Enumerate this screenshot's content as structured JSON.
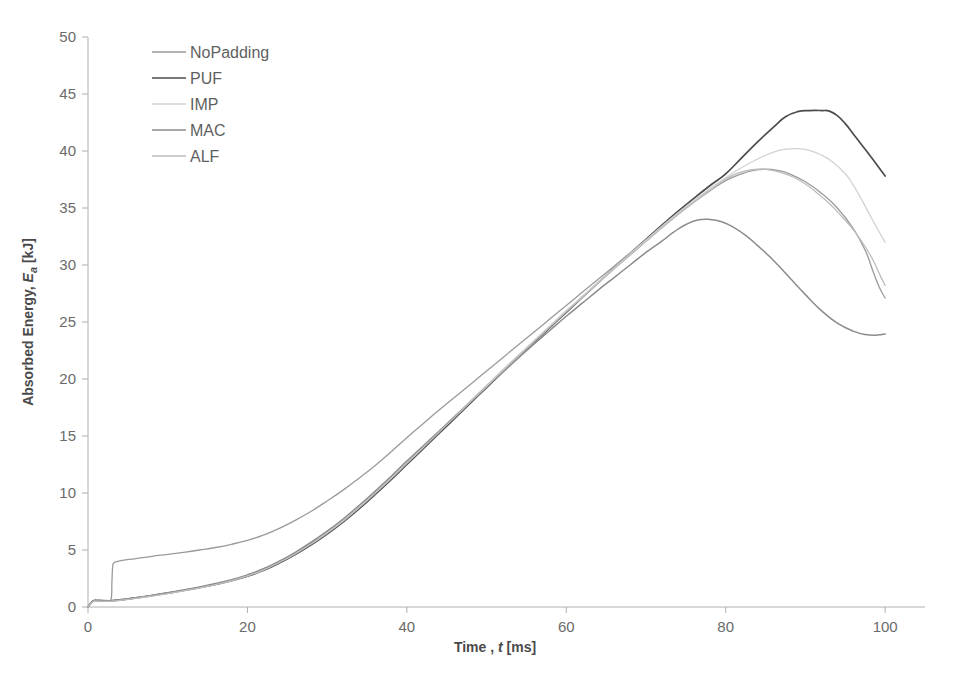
{
  "chart_data": {
    "type": "line",
    "title": "",
    "xlabel": "Time , t [ms]",
    "xlabel_prefix": "Time , ",
    "xlabel_italic": "t",
    "xlabel_suffix": " [ms]",
    "ylabel": "Absorbed Energy, Ea [kJ]",
    "ylabel_prefix": "Absorbed Energy, ",
    "ylabel_italic": "E",
    "ylabel_sub": "a",
    "ylabel_suffix": " [kJ]",
    "xlim": [
      0,
      105
    ],
    "ylim": [
      0,
      50
    ],
    "xticks": [
      0,
      20,
      40,
      60,
      80,
      100
    ],
    "yticks": [
      0,
      5,
      10,
      15,
      20,
      25,
      30,
      35,
      40,
      45,
      50
    ],
    "grid": false,
    "legend_position": "top-left-inside",
    "series": [
      {
        "name": "NoPadding",
        "color": "#9a9a9a",
        "width": 1.3,
        "points": [
          [
            0,
            0.0
          ],
          [
            0.6,
            0.55
          ],
          [
            1.2,
            0.62
          ],
          [
            1.8,
            0.6
          ],
          [
            2.4,
            0.58
          ],
          [
            2.9,
            0.7
          ],
          [
            3.0,
            2.2
          ],
          [
            3.1,
            3.55
          ],
          [
            3.3,
            3.9
          ],
          [
            4.0,
            4.05
          ],
          [
            6.0,
            4.25
          ],
          [
            8.0,
            4.45
          ],
          [
            10.0,
            4.62
          ],
          [
            12.0,
            4.8
          ],
          [
            14.0,
            5.0
          ],
          [
            16.0,
            5.22
          ],
          [
            18.0,
            5.5
          ],
          [
            20.0,
            5.85
          ],
          [
            22.0,
            6.3
          ],
          [
            24.0,
            6.9
          ],
          [
            26.0,
            7.6
          ],
          [
            28.0,
            8.4
          ],
          [
            30.0,
            9.3
          ],
          [
            32.0,
            10.25
          ],
          [
            34.0,
            11.3
          ],
          [
            36.0,
            12.4
          ],
          [
            38.0,
            13.6
          ],
          [
            40.0,
            14.85
          ],
          [
            42.0,
            16.05
          ],
          [
            44.0,
            17.25
          ],
          [
            46.0,
            18.4
          ],
          [
            48.0,
            19.55
          ],
          [
            50.0,
            20.7
          ],
          [
            52.0,
            21.85
          ],
          [
            54.0,
            23.0
          ],
          [
            56.0,
            24.15
          ],
          [
            58.0,
            25.3
          ],
          [
            60.0,
            26.45
          ],
          [
            62.0,
            27.6
          ],
          [
            64.0,
            28.75
          ],
          [
            66.0,
            29.9
          ],
          [
            68.0,
            31.05
          ],
          [
            70.0,
            32.2
          ],
          [
            72.0,
            33.35
          ],
          [
            74.0,
            34.45
          ],
          [
            76.0,
            35.5
          ],
          [
            78.0,
            36.5
          ],
          [
            80.0,
            37.4
          ],
          [
            82.0,
            38.0
          ],
          [
            83.5,
            38.3
          ],
          [
            85.0,
            38.4
          ],
          [
            86.5,
            38.3
          ],
          [
            88.0,
            38.0
          ],
          [
            90.0,
            37.3
          ],
          [
            92.0,
            36.3
          ],
          [
            94.0,
            35.0
          ],
          [
            96.0,
            33.2
          ],
          [
            97.5,
            31.3
          ],
          [
            98.5,
            29.4
          ],
          [
            99.3,
            28.0
          ],
          [
            100.0,
            27.1
          ]
        ]
      },
      {
        "name": "PUF",
        "color": "#4c4c4c",
        "width": 1.7,
        "points": [
          [
            0,
            0.0
          ],
          [
            0.6,
            0.5
          ],
          [
            1.2,
            0.55
          ],
          [
            2.0,
            0.52
          ],
          [
            3.0,
            0.55
          ],
          [
            4.0,
            0.62
          ],
          [
            6.0,
            0.8
          ],
          [
            8.0,
            1.0
          ],
          [
            10.0,
            1.22
          ],
          [
            12.0,
            1.45
          ],
          [
            14.0,
            1.7
          ],
          [
            16.0,
            1.98
          ],
          [
            18.0,
            2.3
          ],
          [
            20.0,
            2.7
          ],
          [
            22.0,
            3.2
          ],
          [
            24.0,
            3.85
          ],
          [
            26.0,
            4.6
          ],
          [
            28.0,
            5.45
          ],
          [
            30.0,
            6.4
          ],
          [
            32.0,
            7.45
          ],
          [
            34.0,
            8.6
          ],
          [
            36.0,
            9.85
          ],
          [
            38.0,
            11.15
          ],
          [
            40.0,
            12.5
          ],
          [
            42.0,
            13.85
          ],
          [
            44.0,
            15.2
          ],
          [
            46.0,
            16.55
          ],
          [
            48.0,
            17.9
          ],
          [
            50.0,
            19.25
          ],
          [
            52.0,
            20.6
          ],
          [
            54.0,
            21.95
          ],
          [
            56.0,
            23.25
          ],
          [
            58.0,
            24.55
          ],
          [
            60.0,
            25.85
          ],
          [
            62.0,
            27.15
          ],
          [
            64.0,
            28.45
          ],
          [
            66.0,
            29.75
          ],
          [
            68.0,
            31.0
          ],
          [
            70.0,
            32.25
          ],
          [
            72.0,
            33.5
          ],
          [
            74.0,
            34.7
          ],
          [
            76.0,
            35.85
          ],
          [
            78.0,
            36.95
          ],
          [
            80.0,
            38.0
          ],
          [
            82.0,
            39.4
          ],
          [
            84.0,
            40.8
          ],
          [
            86.0,
            42.1
          ],
          [
            87.5,
            43.0
          ],
          [
            89.0,
            43.45
          ],
          [
            90.5,
            43.55
          ],
          [
            92.0,
            43.55
          ],
          [
            93.0,
            43.5
          ],
          [
            94.0,
            43.1
          ],
          [
            95.0,
            42.4
          ],
          [
            96.0,
            41.5
          ],
          [
            97.0,
            40.6
          ],
          [
            98.0,
            39.7
          ],
          [
            99.0,
            38.75
          ],
          [
            100.0,
            37.8
          ]
        ]
      },
      {
        "name": "IMP",
        "color": "#d2d2d2",
        "width": 1.3,
        "points": [
          [
            0,
            0.0
          ],
          [
            0.6,
            0.48
          ],
          [
            1.2,
            0.54
          ],
          [
            2.0,
            0.52
          ],
          [
            3.0,
            0.54
          ],
          [
            4.0,
            0.6
          ],
          [
            6.0,
            0.78
          ],
          [
            8.0,
            0.98
          ],
          [
            10.0,
            1.2
          ],
          [
            12.0,
            1.44
          ],
          [
            14.0,
            1.7
          ],
          [
            16.0,
            2.0
          ],
          [
            18.0,
            2.34
          ],
          [
            20.0,
            2.75
          ],
          [
            22.0,
            3.28
          ],
          [
            24.0,
            3.95
          ],
          [
            26.0,
            4.72
          ],
          [
            28.0,
            5.58
          ],
          [
            30.0,
            6.55
          ],
          [
            32.0,
            7.6
          ],
          [
            34.0,
            8.78
          ],
          [
            36.0,
            10.05
          ],
          [
            38.0,
            11.35
          ],
          [
            40.0,
            12.7
          ],
          [
            42.0,
            14.05
          ],
          [
            44.0,
            15.4
          ],
          [
            46.0,
            16.75
          ],
          [
            48.0,
            18.1
          ],
          [
            50.0,
            19.45
          ],
          [
            52.0,
            20.8
          ],
          [
            54.0,
            22.1
          ],
          [
            56.0,
            23.4
          ],
          [
            58.0,
            24.7
          ],
          [
            60.0,
            26.0
          ],
          [
            62.0,
            27.25
          ],
          [
            64.0,
            28.5
          ],
          [
            66.0,
            29.75
          ],
          [
            68.0,
            31.0
          ],
          [
            70.0,
            32.2
          ],
          [
            72.0,
            33.4
          ],
          [
            74.0,
            34.55
          ],
          [
            76.0,
            35.65
          ],
          [
            78.0,
            36.7
          ],
          [
            80.0,
            37.65
          ],
          [
            82.0,
            38.55
          ],
          [
            84.0,
            39.3
          ],
          [
            86.0,
            39.9
          ],
          [
            87.5,
            40.15
          ],
          [
            89.0,
            40.2
          ],
          [
            90.5,
            40.05
          ],
          [
            92.0,
            39.65
          ],
          [
            93.5,
            39.0
          ],
          [
            95.0,
            38.0
          ],
          [
            96.0,
            37.0
          ],
          [
            97.0,
            35.8
          ],
          [
            98.0,
            34.5
          ],
          [
            99.0,
            33.2
          ],
          [
            100.0,
            32.0
          ]
        ]
      },
      {
        "name": "MAC",
        "color": "#8c8c8c",
        "width": 1.5,
        "points": [
          [
            0,
            0.0
          ],
          [
            0.6,
            0.5
          ],
          [
            1.2,
            0.56
          ],
          [
            2.0,
            0.54
          ],
          [
            3.0,
            0.56
          ],
          [
            4.0,
            0.64
          ],
          [
            6.0,
            0.82
          ],
          [
            8.0,
            1.02
          ],
          [
            10.0,
            1.25
          ],
          [
            12.0,
            1.5
          ],
          [
            14.0,
            1.76
          ],
          [
            16.0,
            2.06
          ],
          [
            18.0,
            2.4
          ],
          [
            20.0,
            2.82
          ],
          [
            22.0,
            3.35
          ],
          [
            24.0,
            4.02
          ],
          [
            26.0,
            4.8
          ],
          [
            28.0,
            5.68
          ],
          [
            30.0,
            6.65
          ],
          [
            32.0,
            7.72
          ],
          [
            34.0,
            8.9
          ],
          [
            36.0,
            10.15
          ],
          [
            38.0,
            11.45
          ],
          [
            40.0,
            12.8
          ],
          [
            42.0,
            14.1
          ],
          [
            44.0,
            15.4
          ],
          [
            46.0,
            16.7
          ],
          [
            48.0,
            18.0
          ],
          [
            50.0,
            19.3
          ],
          [
            52.0,
            20.6
          ],
          [
            54.0,
            21.85
          ],
          [
            56.0,
            23.1
          ],
          [
            58.0,
            24.3
          ],
          [
            60.0,
            25.5
          ],
          [
            62.0,
            26.65
          ],
          [
            64.0,
            27.8
          ],
          [
            66.0,
            28.9
          ],
          [
            68.0,
            30.0
          ],
          [
            70.0,
            31.1
          ],
          [
            72.0,
            32.1
          ],
          [
            73.5,
            32.9
          ],
          [
            75.0,
            33.55
          ],
          [
            76.5,
            33.95
          ],
          [
            78.0,
            34.0
          ],
          [
            79.5,
            33.8
          ],
          [
            81.0,
            33.3
          ],
          [
            82.5,
            32.6
          ],
          [
            84.0,
            31.7
          ],
          [
            86.0,
            30.4
          ],
          [
            88.0,
            28.9
          ],
          [
            90.0,
            27.4
          ],
          [
            92.0,
            26.0
          ],
          [
            94.0,
            24.9
          ],
          [
            96.0,
            24.2
          ],
          [
            97.5,
            23.9
          ],
          [
            99.0,
            23.85
          ],
          [
            100.0,
            23.95
          ]
        ]
      },
      {
        "name": "ALF",
        "color": "#bdbdbd",
        "width": 1.3,
        "points": [
          [
            0,
            0.0
          ],
          [
            0.6,
            0.46
          ],
          [
            1.2,
            0.52
          ],
          [
            2.0,
            0.5
          ],
          [
            3.0,
            0.52
          ],
          [
            4.0,
            0.58
          ],
          [
            6.0,
            0.76
          ],
          [
            8.0,
            0.96
          ],
          [
            10.0,
            1.18
          ],
          [
            12.0,
            1.42
          ],
          [
            14.0,
            1.68
          ],
          [
            16.0,
            1.96
          ],
          [
            18.0,
            2.3
          ],
          [
            20.0,
            2.72
          ],
          [
            22.0,
            3.24
          ],
          [
            24.0,
            3.9
          ],
          [
            26.0,
            4.66
          ],
          [
            28.0,
            5.52
          ],
          [
            30.0,
            6.48
          ],
          [
            32.0,
            7.52
          ],
          [
            34.0,
            8.7
          ],
          [
            36.0,
            9.95
          ],
          [
            38.0,
            11.25
          ],
          [
            40.0,
            12.6
          ],
          [
            42.0,
            13.95
          ],
          [
            44.0,
            15.3
          ],
          [
            46.0,
            16.65
          ],
          [
            48.0,
            18.0
          ],
          [
            50.0,
            19.35
          ],
          [
            52.0,
            20.7
          ],
          [
            54.0,
            22.0
          ],
          [
            56.0,
            23.3
          ],
          [
            58.0,
            24.6
          ],
          [
            60.0,
            25.9
          ],
          [
            62.0,
            27.15
          ],
          [
            64.0,
            28.4
          ],
          [
            66.0,
            29.65
          ],
          [
            68.0,
            30.85
          ],
          [
            70.0,
            32.05
          ],
          [
            72.0,
            33.25
          ],
          [
            74.0,
            34.4
          ],
          [
            76.0,
            35.5
          ],
          [
            78.0,
            36.55
          ],
          [
            79.5,
            37.3
          ],
          [
            81.0,
            37.9
          ],
          [
            82.5,
            38.25
          ],
          [
            84.0,
            38.4
          ],
          [
            85.5,
            38.35
          ],
          [
            87.0,
            38.1
          ],
          [
            88.5,
            37.7
          ],
          [
            90.0,
            37.1
          ],
          [
            91.5,
            36.3
          ],
          [
            93.0,
            35.4
          ],
          [
            94.5,
            34.3
          ],
          [
            96.0,
            33.1
          ],
          [
            97.5,
            31.6
          ],
          [
            98.5,
            30.4
          ],
          [
            99.3,
            29.2
          ],
          [
            100.0,
            28.2
          ]
        ]
      }
    ]
  },
  "legend": {
    "entries": [
      {
        "label": "NoPadding"
      },
      {
        "label": "PUF"
      },
      {
        "label": "IMP"
      },
      {
        "label": "MAC"
      },
      {
        "label": "ALF"
      }
    ]
  }
}
